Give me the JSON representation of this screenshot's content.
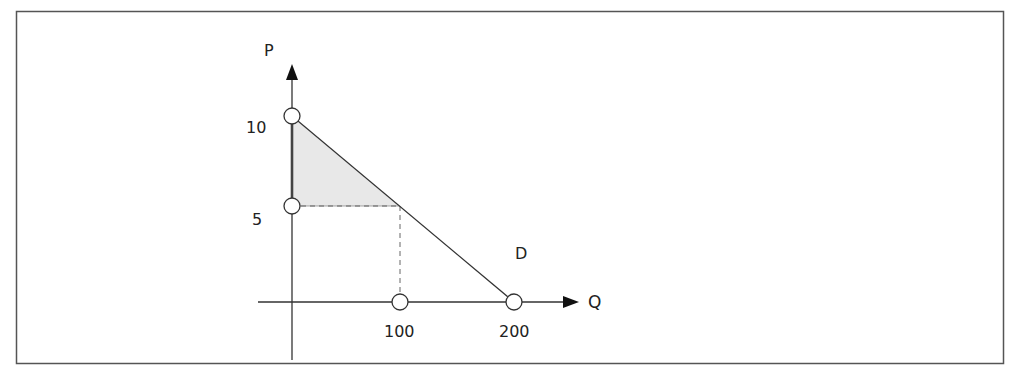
{
  "diagram": {
    "type": "supply-demand",
    "axes": {
      "y_label": "P",
      "x_label": "Q"
    },
    "y_ticks": [
      {
        "label": "10",
        "value": 10
      },
      {
        "label": "5",
        "value": 5
      }
    ],
    "x_ticks": [
      {
        "label": "100",
        "value": 100
      },
      {
        "label": "200",
        "value": 200
      }
    ],
    "curve_label": "D",
    "curve": {
      "name": "Demand",
      "points": [
        [
          0,
          10
        ],
        [
          100,
          5
        ],
        [
          200,
          0
        ]
      ]
    },
    "shaded_region": {
      "name": "consumer surplus",
      "vertices": [
        [
          0,
          10
        ],
        [
          0,
          5
        ],
        [
          100,
          5
        ]
      ],
      "color": "#e6e6e6"
    },
    "guides": [
      {
        "from": [
          0,
          5
        ],
        "to": [
          100,
          5
        ],
        "style": "dashed"
      },
      {
        "from": [
          100,
          5
        ],
        "to": [
          100,
          0
        ],
        "style": "dashed"
      }
    ],
    "colors": {
      "line": "#333333",
      "border": "#555555",
      "fill": "#e6e6e6"
    }
  }
}
